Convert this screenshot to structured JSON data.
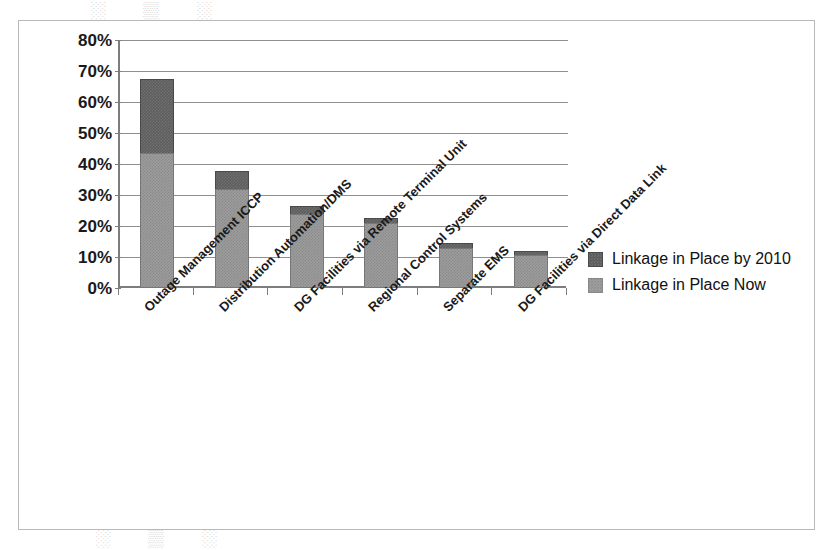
{
  "figure": {
    "watermark_top": "░ ▒ ░",
    "watermark_bottom": "░ ▒ ░"
  },
  "chart_data": {
    "type": "bar",
    "stacked": true,
    "title": "",
    "xlabel": "",
    "ylabel": "",
    "ylim": [
      0,
      80
    ],
    "ytick_step": 10,
    "grid": true,
    "legend_position": "right",
    "ytick_labels": [
      "80%",
      "70%",
      "60%",
      "50%",
      "40%",
      "30%",
      "20%",
      "10%",
      "0%"
    ],
    "categories": [
      "Outage Management ICCP",
      "Distribution Automation/DMS",
      "DG Facilities via Remote Terminal Unit",
      "Regional Control Systems",
      "Separate EMS",
      "DG Facilities via Direct Data Link"
    ],
    "series": [
      {
        "name": "Linkage in Place Now",
        "color": "#9c9c9c",
        "values": [
          43.5,
          32.0,
          24.0,
          21.0,
          13.0,
          10.5
        ]
      },
      {
        "name": "Linkage in Place by 2010",
        "color": "#5e5e5e",
        "values": [
          23.9,
          5.7,
          2.5,
          1.5,
          1.5,
          1.5
        ]
      }
    ],
    "totals": [
      67.4,
      37.7,
      26.5,
      22.5,
      14.5,
      12.0
    ]
  },
  "legend": {
    "items": [
      {
        "label": "Linkage in Place by 2010",
        "swatch": "sw-2010"
      },
      {
        "label": "Linkage in Place Now",
        "swatch": "sw-now"
      }
    ]
  }
}
